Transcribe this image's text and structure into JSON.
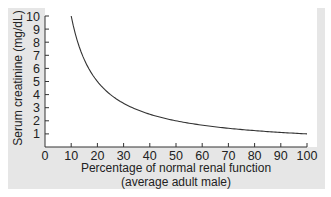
{
  "chart_data": {
    "type": "line",
    "title": "",
    "xlabel": "Percentage of normal renal function",
    "xlabel_line2": "(average adult male)",
    "ylabel": "Serum creatinine (mg/dL)",
    "xlim": [
      0,
      100
    ],
    "ylim": [
      0,
      10
    ],
    "x_ticks": [
      0,
      10,
      20,
      30,
      40,
      50,
      60,
      70,
      80,
      90,
      100
    ],
    "y_ticks": [
      1,
      2,
      3,
      4,
      5,
      6,
      7,
      8,
      9,
      10
    ],
    "grid": false,
    "legend": null,
    "series": [
      {
        "name": "Serum creatinine vs renal function",
        "x": [
          10,
          12,
          15,
          20,
          25,
          30,
          40,
          50,
          60,
          70,
          80,
          90,
          100
        ],
        "values": [
          10,
          8.3,
          6.7,
          5.0,
          4.0,
          3.3,
          2.5,
          2.0,
          1.7,
          1.4,
          1.25,
          1.1,
          1.0
        ]
      }
    ],
    "colors": {
      "line": "#333333",
      "plot_background": "#ffffff",
      "panel_background": "#e6e6e6"
    }
  }
}
